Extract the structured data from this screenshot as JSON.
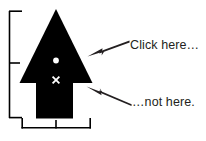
{
  "figure": {
    "type": "annotated-diagram",
    "background_color": "#ffffff",
    "ink_color": "#000000",
    "text_color": "#231f20",
    "marker_color": "#ffffff"
  },
  "annotations": {
    "click_here": {
      "label": "Click here…",
      "icon": "arrow-left-icon",
      "points_to": "arrowhead-triangle"
    },
    "not_here": {
      "label": "…not here.",
      "icon": "arrow-left-icon",
      "points_to": "arrow-shaft"
    }
  },
  "shape": {
    "name": "up-arrow-glyph",
    "parts": [
      {
        "name": "arrowhead-triangle",
        "marker": "white-dot"
      },
      {
        "name": "arrow-shaft",
        "marker": "white-x"
      }
    ],
    "markers": {
      "dot": {
        "name": "white-dot-marker",
        "glyph": "●"
      },
      "cross": {
        "name": "white-x-marker",
        "glyph": "×"
      }
    }
  },
  "measurements": {
    "vertical_bracket": {
      "name": "height-bracket",
      "ticks": 3,
      "label": ""
    },
    "horizontal_bracket": {
      "name": "width-bracket",
      "ticks": 3,
      "label": ""
    }
  }
}
